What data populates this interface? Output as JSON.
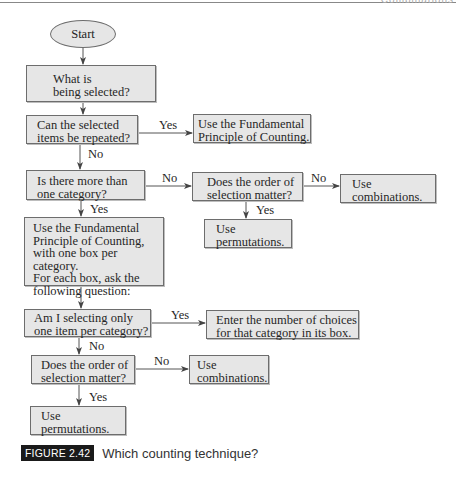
{
  "page_header": {
    "text": "Combinations"
  },
  "flowchart": {
    "start": {
      "label": "Start"
    },
    "nodes": {
      "what_selected": "What is\nbeing selected?",
      "repeated": "Can the selected\nitems be repeated?",
      "fpc_simple": "Use the Fundamental\nPrinciple of Counting.",
      "more_than_one": "Is there more than\none category?",
      "order_matters_1": "Does the order of\nselection matter?",
      "combinations_1": "Use\ncombinations.",
      "permutations_1": "Use\npermutations.",
      "fpc_boxes": "Use the Fundamental\nPrinciple of Counting,\nwith one box per category.\nFor each box, ask the\nfollowing question:",
      "one_item": "Am I selecting only\none item per category?",
      "enter_choices": "Enter the number of choices\nfor that category in its box.",
      "order_matters_2": "Does the order of\nselection matter?",
      "combinations_2": "Use\ncombinations.",
      "permutations_2": "Use\npermutations."
    },
    "edge_labels": {
      "repeated_yes": "Yes",
      "repeated_no": "No",
      "more_no": "No",
      "more_yes": "Yes",
      "order1_no": "No",
      "order1_yes": "Yes",
      "one_item_yes": "Yes",
      "one_item_no": "No",
      "order2_no": "No",
      "order2_yes": "Yes"
    }
  },
  "caption": {
    "tag": "FIGURE 2.42",
    "title": "Which counting technique?"
  },
  "colors": {
    "box_fill": "#e6e6e6",
    "box_border": "#6d6d6d",
    "arrow": "#444444",
    "tag_bg": "#1a1a1a"
  }
}
